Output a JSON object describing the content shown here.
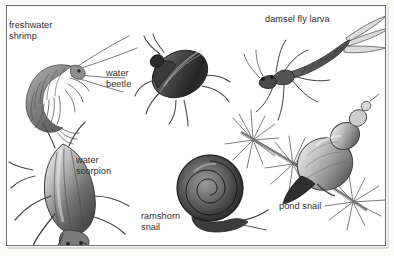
{
  "plate": {
    "kind": "natural-history-illustration",
    "subject": "pond freshwater invertebrates",
    "background_color": "#ffffff",
    "frame_color": "#6d6d6d",
    "ink_color": "#2e2e2e",
    "technique": "graphite pencil grayscale drawings"
  },
  "labels": {
    "freshwater_shrimp": "freshwater\nshrimp",
    "water_beetle": "water\nbeetle",
    "damsel_fly_larva": "damsel fly larva",
    "water_scorpion": "water\nscorpion",
    "ramshorn_snail": "ramshorn\nsnail",
    "pond_snail": "pond snail"
  },
  "specimens": [
    {
      "id": "freshwater-shrimp",
      "label": "freshwater shrimp",
      "position": {
        "x": 10,
        "y": 34
      },
      "size": {
        "w": 112,
        "h": 86
      }
    },
    {
      "id": "water-beetle",
      "label": "water beetle",
      "position": {
        "x": 133,
        "y": 36
      },
      "size": {
        "w": 80,
        "h": 84
      }
    },
    {
      "id": "damsel-fly-larva",
      "label": "damsel fly larva",
      "position": {
        "x": 247,
        "y": 22
      },
      "size": {
        "w": 132,
        "h": 86
      }
    },
    {
      "id": "water-scorpion",
      "label": "water scorpion",
      "position": {
        "x": 10,
        "y": 126
      },
      "size": {
        "w": 122,
        "h": 114
      }
    },
    {
      "id": "ramshorn-snail",
      "label": "ramshorn snail",
      "position": {
        "x": 163,
        "y": 152
      },
      "size": {
        "w": 100,
        "h": 92
      }
    },
    {
      "id": "pond-snail",
      "label": "pond snail",
      "position": {
        "x": 238,
        "y": 100
      },
      "size": {
        "w": 148,
        "h": 140
      }
    }
  ]
}
